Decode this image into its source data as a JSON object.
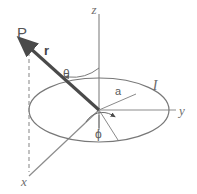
{
  "figure": {
    "type": "physics-vector-diagram",
    "width": 197,
    "height": 194,
    "background_color": "#ffffff"
  },
  "colors": {
    "axis_stroke": "#8c8c8c",
    "loop_stroke": "#787878",
    "vector_stroke": "#4a4a4a",
    "dashed_stroke": "#909090",
    "arc_stroke": "#7a7a7a",
    "text_color": "#5a5a5a"
  },
  "labels": {
    "z_axis": "z",
    "y_axis": "y",
    "x_axis": "x",
    "field_point": "P",
    "position_vector": "r",
    "polar_angle": "θ",
    "azimuthal_angle": "ϕ",
    "loop_radius": "a",
    "current": "I"
  },
  "elements": {
    "origin": {
      "x": 99,
      "y": 110
    },
    "z_axis_tip": {
      "x": 99,
      "y": 14
    },
    "y_axis_tip": {
      "x": 176,
      "y": 110
    },
    "x_axis_tip": {
      "x": 29,
      "y": 176
    },
    "point_P": {
      "x": 24,
      "y": 46
    },
    "loop": {
      "center_x": 99,
      "center_y": 110,
      "radius_x": 70,
      "radius_y": 32,
      "shape": "ellipse"
    },
    "radius_segment_end": {
      "x": 124,
      "y": 91
    },
    "phi_segment_end": {
      "x": 105,
      "y": 141
    }
  },
  "annotations": {
    "theta_description": "polar angle measured from the z-axis to r",
    "phi_description": "azimuthal angle measured in the xy-plane from x toward the radius line",
    "r_description": "position vector from origin to field point P",
    "a_description": "radius of the circular current loop",
    "I_description": "current circulating in the loop"
  }
}
